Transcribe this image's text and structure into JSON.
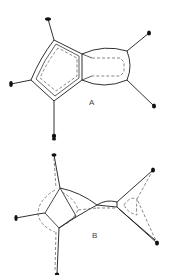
{
  "figure": {
    "panels": [
      {
        "id": "A",
        "label": "A",
        "description": "Fused five- and four-membered ring structure with bonding (solid) and dashed inner contours; six terminal atoms"
      },
      {
        "id": "B",
        "label": "B",
        "description": "Distorted polyhedral cage structure with solid and dashed edge contours; five terminal atoms"
      }
    ],
    "colors": {
      "line": "#1a1a1a",
      "dashed": "#555555",
      "background": "#ffffff"
    }
  }
}
